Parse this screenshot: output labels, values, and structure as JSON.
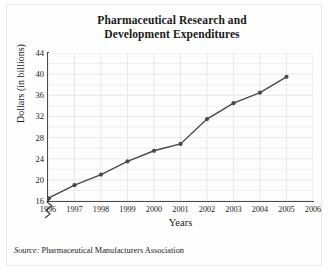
{
  "chart_data": {
    "type": "line",
    "title": "Pharmaceutical Research and Development Expenditures",
    "title_line1": "Pharmaceutical Research and",
    "title_line2": "Development Expenditures",
    "xlabel": "Years",
    "ylabel": "Dollars (in billions)",
    "categories": [
      "1996",
      "1997",
      "1998",
      "1999",
      "2000",
      "2001",
      "2002",
      "2003",
      "2004",
      "2005",
      "2006"
    ],
    "x_tick_labels": [
      "1996",
      "1997",
      "1998",
      "1999",
      "2000",
      "2001",
      "2002",
      "2003",
      "2004",
      "2005",
      "2006"
    ],
    "y_tick_labels": [
      "16",
      "20",
      "24",
      "28",
      "32",
      "36",
      "40",
      "44"
    ],
    "y_tick_values": [
      16,
      20,
      24,
      28,
      32,
      36,
      40,
      44
    ],
    "ylim": [
      16,
      44
    ],
    "y_axis_broken": true,
    "grid": true,
    "legend": "none",
    "marker": "filled-circle",
    "line_color": "#4a4a4a",
    "grid_color": "#e3e3e8",
    "series": [
      {
        "name": "R&D Expenditures",
        "x": [
          "1996",
          "1997",
          "1998",
          "1999",
          "2000",
          "2001",
          "2002",
          "2003",
          "2004",
          "2005"
        ],
        "values": [
          16.5,
          19.0,
          21.0,
          23.5,
          25.5,
          26.8,
          31.5,
          34.5,
          36.5,
          39.5
        ]
      }
    ],
    "source_label": "Source:",
    "source_text": "Pharmaceutical Manufacturers Association"
  }
}
